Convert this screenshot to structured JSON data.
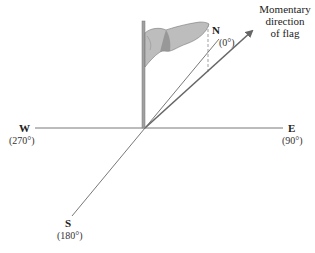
{
  "diagram": {
    "compass": {
      "north": {
        "label": "N",
        "degrees": "(0°)"
      },
      "east": {
        "label": "E",
        "degrees": "(90°)"
      },
      "south": {
        "label": "S",
        "degrees": "(180°)"
      },
      "west": {
        "label": "W",
        "degrees": "(270°)"
      }
    },
    "arrow_label": {
      "line1": "Momentary",
      "line2": "direction",
      "line3": "of flag"
    },
    "colors": {
      "axis": "#555555",
      "arrow": "#666666",
      "flag_fill": "#b8b8b8",
      "flag_shade": "#8a8a8a",
      "pole": "#9a9a9a"
    }
  }
}
